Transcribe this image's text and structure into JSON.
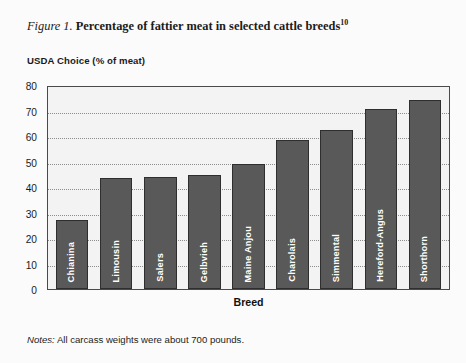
{
  "figure": {
    "number_label": "Figure 1.",
    "title": "Percentage of fattier meat in selected cattle breeds",
    "footnote_marker": "10",
    "notes_label": "Notes:",
    "notes_text": "All carcass weights were about 700 pounds."
  },
  "colors": {
    "bar_fill": "#595959",
    "bar_stroke": "#2e2e2e",
    "plot_background": "#f3f3f3",
    "plot_border": "#4a4a4a",
    "gridline": "#8d8d8d",
    "label_text": "#ffffff",
    "page_background": "#fbfbfb"
  },
  "chart_data": {
    "type": "bar",
    "title": "Percentage of fattier meat in selected cattle breeds",
    "xlabel": "Breed",
    "ylabel": "USDA Choice (% of meat)",
    "ylim": [
      0,
      80
    ],
    "ytick_step": 10,
    "yticks": [
      80,
      70,
      60,
      50,
      40,
      30,
      20,
      10,
      0
    ],
    "grid": true,
    "grid_axis": "y",
    "grid_style": "dotted",
    "legend": false,
    "categories": [
      "Chianina",
      "Limousin",
      "Salers",
      "Gelbvieh",
      "Maine Anjou",
      "Charolais",
      "Simmental",
      "Hereford-Angus",
      "Shorthorn"
    ],
    "values": [
      27,
      43.5,
      44,
      44.8,
      49,
      58.5,
      62.5,
      70.5,
      74
    ],
    "bar_labels_inside": true,
    "bar_label_rotation": 90
  }
}
